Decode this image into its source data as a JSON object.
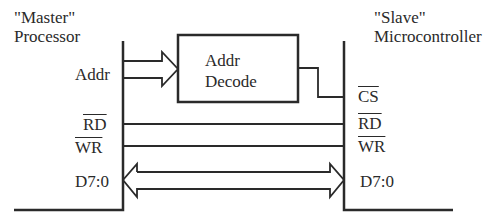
{
  "diagram": {
    "master": {
      "title_line1": "\"Master\"",
      "title_line2": "Processor"
    },
    "slave": {
      "title_line1": "\"Slave\"",
      "title_line2": "Microcontroller"
    },
    "decoder": {
      "line1": "Addr",
      "line2": "Decode"
    },
    "signals": {
      "addr": "Addr",
      "cs": "CS",
      "rd_master": "RD",
      "wr_master": "WR",
      "rd_slave": "RD",
      "wr_slave": "WR",
      "data_master": "D7:0",
      "data_slave": "D7:0"
    },
    "colors": {
      "line": "#2a2a2a",
      "background": "#ffffff"
    }
  }
}
